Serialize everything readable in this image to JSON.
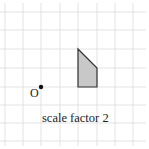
{
  "diagram": {
    "type": "enlargement-grid",
    "grid": {
      "x_lines": [
        5,
        23,
        41,
        60,
        78,
        97,
        115,
        133
      ],
      "y_lines": [
        12,
        30,
        49,
        68,
        87,
        105,
        123,
        141
      ],
      "line_color": "#dcdcdc"
    },
    "shape": {
      "points": "78,49 97,68 97,87 78,87",
      "fill": "#c8c8c8",
      "stroke": "#333333"
    },
    "centre": {
      "label": "O",
      "x": 41,
      "y": 87
    },
    "caption": "scale factor 2"
  }
}
